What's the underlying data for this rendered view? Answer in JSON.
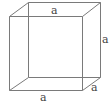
{
  "diagram": {
    "type": "cube",
    "edge_color": "#7a7a7a",
    "label_color": "#444444",
    "front_face": {
      "tl": [
        9,
        16
      ],
      "tr": [
        82,
        16
      ],
      "br": [
        82,
        90
      ],
      "bl": [
        9,
        90
      ]
    },
    "back_face": {
      "tl": [
        28,
        2
      ],
      "tr": [
        100,
        2
      ],
      "br": [
        100,
        77
      ],
      "bl": [
        28,
        77
      ]
    },
    "labels": {
      "top": "a",
      "right": "a",
      "bottom": "a",
      "depth": "a"
    }
  }
}
